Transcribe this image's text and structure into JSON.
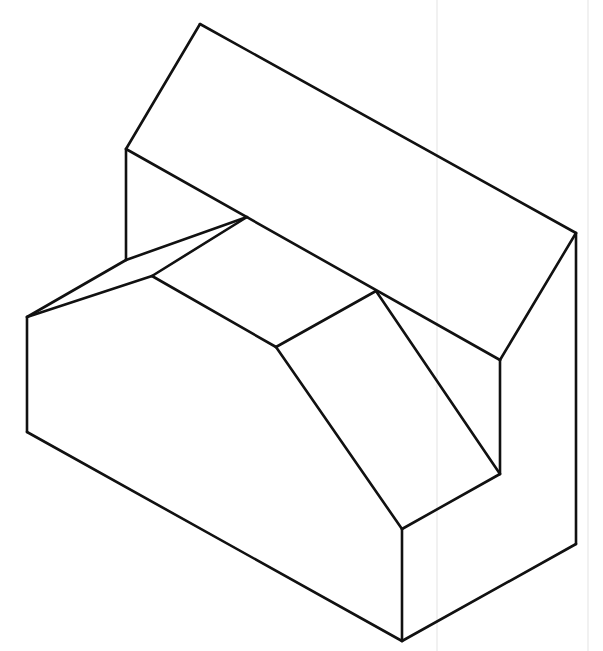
{
  "figure": {
    "type": "isometric-line-drawing",
    "colors": {
      "background": "#ffffff",
      "line": "#111111",
      "scan_artifact": "#ededed"
    },
    "vertices": {
      "A_top": [
        200,
        24
      ],
      "B_back_left_top": [
        126,
        149
      ],
      "C_right_top": [
        576,
        233
      ],
      "D_ridge_right": [
        500,
        360
      ],
      "E_ridge_left": [
        247,
        217
      ],
      "F_left_wall_lower": [
        126,
        260
      ],
      "G_chamfer_inner": [
        152,
        276
      ],
      "H_front_left_top": [
        27,
        317
      ],
      "I_front_left_bottom": [
        27,
        432
      ],
      "J_slot_front_left": [
        276,
        347
      ],
      "K_slot_back": [
        376,
        291
      ],
      "L_notch_bottom": [
        500,
        474
      ],
      "M_front_corner_top": [
        402,
        529
      ],
      "N_front_corner_bottom": [
        402,
        641
      ],
      "O_right_bottom": [
        576,
        544
      ]
    },
    "edges": [
      [
        "A_top",
        "B_back_left_top"
      ],
      [
        "A_top",
        "C_right_top"
      ],
      [
        "B_back_left_top",
        "D_ridge_right"
      ],
      [
        "C_right_top",
        "D_ridge_right"
      ],
      [
        "B_back_left_top",
        "F_left_wall_lower"
      ],
      [
        "C_right_top",
        "O_right_bottom"
      ],
      [
        "D_ridge_right",
        "L_notch_bottom"
      ],
      [
        "E_ridge_left",
        "F_left_wall_lower"
      ],
      [
        "E_ridge_left",
        "G_chamfer_inner"
      ],
      [
        "F_left_wall_lower",
        "H_front_left_top"
      ],
      [
        "G_chamfer_inner",
        "H_front_left_top"
      ],
      [
        "G_chamfer_inner",
        "J_slot_front_left"
      ],
      [
        "J_slot_front_left",
        "K_slot_back"
      ],
      [
        "K_slot_back",
        "L_notch_bottom"
      ],
      [
        "J_slot_front_left",
        "M_front_corner_top"
      ],
      [
        "L_notch_bottom",
        "M_front_corner_top"
      ],
      [
        "H_front_left_top",
        "I_front_left_bottom"
      ],
      [
        "I_front_left_bottom",
        "N_front_corner_bottom"
      ],
      [
        "M_front_corner_top",
        "N_front_corner_bottom"
      ],
      [
        "N_front_corner_bottom",
        "O_right_bottom"
      ]
    ],
    "scan_artifacts": [
      {
        "x1": 437,
        "y1": 0,
        "x2": 437,
        "y2": 651
      },
      {
        "x1": 588,
        "y1": 0,
        "x2": 588,
        "y2": 651
      }
    ]
  }
}
